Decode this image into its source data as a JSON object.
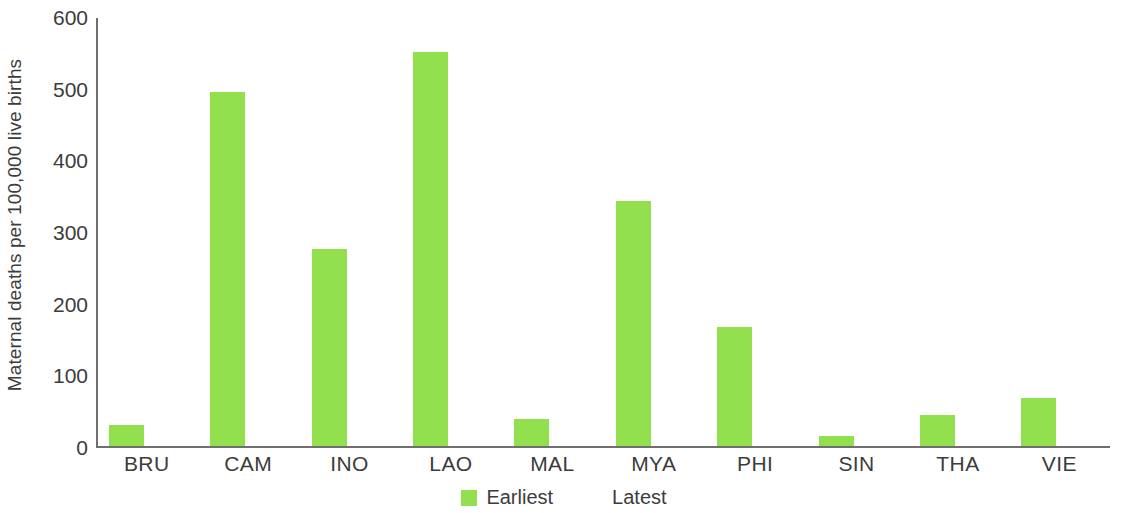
{
  "chart_data": {
    "type": "bar",
    "title": "",
    "xlabel": "",
    "ylabel": "Maternal deaths per 100,000 live births",
    "ylim": [
      0,
      600
    ],
    "yticks": [
      0,
      100,
      200,
      300,
      400,
      500,
      600
    ],
    "grid": false,
    "legend_position": "bottom-center",
    "categories": [
      "BRU",
      "CAM",
      "INO",
      "LAO",
      "MAL",
      "MYA",
      "PHI",
      "SIN",
      "THA",
      "VIE"
    ],
    "series": [
      {
        "name": "Earliest",
        "color": "#93e04e",
        "values": [
          30,
          497,
          276,
          552,
          38,
          344,
          167,
          14,
          44,
          68
        ]
      },
      {
        "name": "Latest",
        "color": "#f9c council",
        "values": [
          27,
          165,
          182,
          190,
          26,
          250,
          123,
          6,
          37,
          43
        ]
      }
    ]
  },
  "colors": {
    "earliest": "#93e04e",
    "latest": "#f9c council",
    "axis": "#6f6f6f",
    "text": "#3c3c3c",
    "background": "#ffffff"
  }
}
